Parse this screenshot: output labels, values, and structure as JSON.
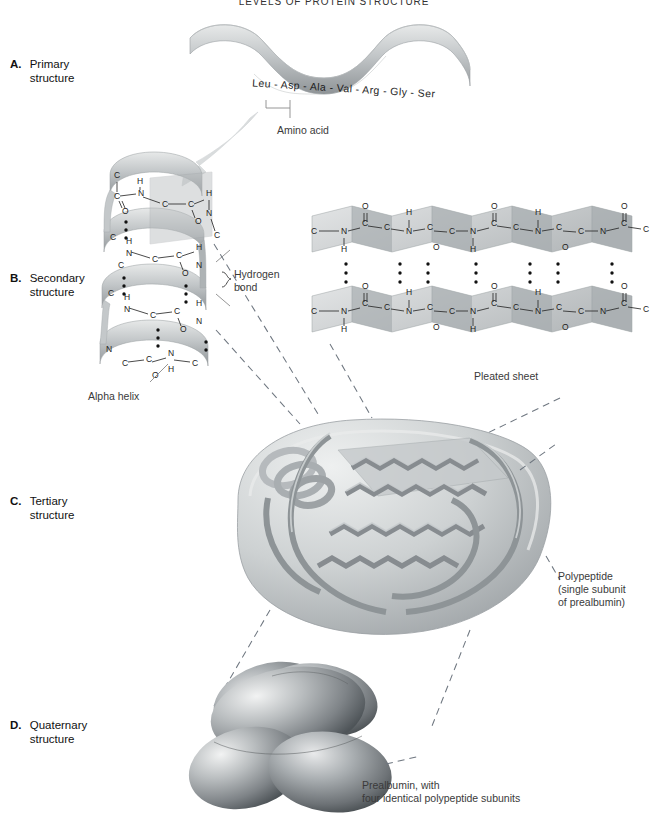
{
  "figure": {
    "title": "LEVELS OF PROTEIN STRUCTURE",
    "width": 668,
    "height": 822,
    "palette": {
      "background": "#ffffff",
      "ribbon_light": "#d8dadb",
      "ribbon_mid": "#b4b8ba",
      "ribbon_dark": "#8d9295",
      "text": "#1a1a1a",
      "caption_text": "#3a3a3a",
      "dash_line": "#6f7780"
    }
  },
  "levels": [
    {
      "letter": "A.",
      "name": "Primary\nstructure",
      "line1": "Primary",
      "line2": "structure"
    },
    {
      "letter": "B.",
      "name": "Secondary\nstructure",
      "line1": "Secondary",
      "line2": "structure"
    },
    {
      "letter": "C.",
      "name": "Tertiary\nstructure",
      "line1": "Tertiary",
      "line2": "structure"
    },
    {
      "letter": "D.",
      "name": "Quaternary\nstructure",
      "line1": "Quaternary",
      "line2": "structure"
    }
  ],
  "primary": {
    "sequence_text": "Leu - Asp - Ala - Val - Arg - Gly - Ser",
    "residues": [
      "Leu",
      "Asp",
      "Ala",
      "Val",
      "Arg",
      "Gly",
      "Ser"
    ],
    "callout": "Amino acid"
  },
  "secondary": {
    "hydrogen_bond_label_line1": "Hydrogen",
    "hydrogen_bond_label_line2": "bond",
    "alpha_helix_label": "Alpha helix",
    "pleated_sheet_label": "Pleated sheet",
    "atoms": [
      "C",
      "N",
      "H",
      "O"
    ]
  },
  "tertiary": {
    "caption_line1": "Polypeptide",
    "caption_line2": "(single subunit",
    "caption_line3": "of prealbumin)"
  },
  "quaternary": {
    "caption_line1": "Prealbumin, with",
    "caption_line2": "four identical polypeptide subunits"
  }
}
